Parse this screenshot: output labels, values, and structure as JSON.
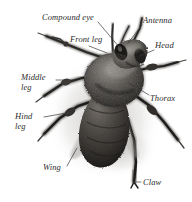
{
  "figure": {
    "kind": "labeled-photograph",
    "background_color": "#ffffff",
    "text_color": "#2b2b2b",
    "width": 192,
    "height": 202
  },
  "labels": [
    {
      "id": "compound-eye",
      "text": "Compound eye",
      "x": 42,
      "y": 13,
      "lines": 1
    },
    {
      "id": "antenna",
      "text": "Antenna",
      "x": 143,
      "y": 16,
      "lines": 1
    },
    {
      "id": "front-leg",
      "text": "Front leg",
      "x": 70,
      "y": 35,
      "lines": 2
    },
    {
      "id": "head",
      "text": "Head",
      "x": 155,
      "y": 41,
      "lines": 1
    },
    {
      "id": "middle-leg",
      "text": "Middle leg",
      "x": 21,
      "y": 73,
      "lines": 2
    },
    {
      "id": "thorax",
      "text": "Thorax",
      "x": 150,
      "y": 94,
      "lines": 1
    },
    {
      "id": "hind-leg",
      "text": "Hind leg",
      "x": 15,
      "y": 112,
      "lines": 2
    },
    {
      "id": "wing",
      "text": "Wing",
      "x": 43,
      "y": 163,
      "lines": 1
    },
    {
      "id": "claw",
      "text": "Claw",
      "x": 143,
      "y": 178,
      "lines": 1
    }
  ],
  "leaders": {
    "stroke": "#3a3a3a",
    "stroke_width": 0.7
  }
}
